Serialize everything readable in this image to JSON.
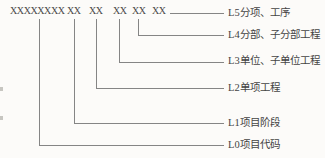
{
  "diagram": {
    "code_groups": [
      "XXXXXXXX",
      "XX",
      "XX",
      "XX",
      "XX",
      "XX"
    ],
    "levels": [
      {
        "id": "L5",
        "label": "L5分项、工序"
      },
      {
        "id": "L4",
        "label": "L4分部、子分部工程"
      },
      {
        "id": "L3",
        "label": "L3单位、子单位工程"
      },
      {
        "id": "L2",
        "label": "L2单项工程"
      },
      {
        "id": "L1",
        "label": "L1项目阶段"
      },
      {
        "id": "L0",
        "label": "L0项目代码"
      }
    ],
    "colors": {
      "background": "#fcfbf9",
      "text": "#4a4a4a",
      "line": "#858585"
    }
  }
}
